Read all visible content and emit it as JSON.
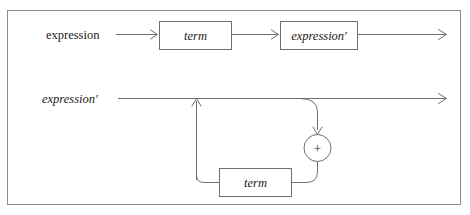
{
  "figure": {
    "caption_remnant": "",
    "frame_color": "#8c8c8c",
    "rail_color": "#6e6e6e",
    "background": "#ffffff"
  },
  "diagram": {
    "type": "syntax-railroad-diagram",
    "rows": [
      {
        "id": "expression-rule",
        "start_label": "expression",
        "start_label_style": "upright",
        "nodes": [
          {
            "id": "term-node-top",
            "label": "term",
            "style": "italic"
          },
          {
            "id": "expression-prime-node",
            "label": "expression′",
            "style": "italic"
          }
        ]
      },
      {
        "id": "expression-prime-rule",
        "start_label": "expression′",
        "start_label_style": "italic",
        "nodes": [
          {
            "id": "term-node-bottom",
            "label": "term",
            "style": "italic"
          }
        ],
        "operator": {
          "id": "plus-operator",
          "label": "+",
          "shape": "circle"
        }
      }
    ]
  },
  "labels": {
    "expression_upright": "expression",
    "expression_prime_italic": "expression′",
    "term": "term",
    "plus": "+"
  }
}
